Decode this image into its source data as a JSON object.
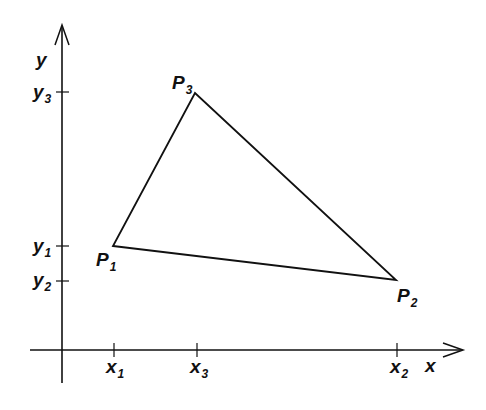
{
  "diagram": {
    "type": "triangle-on-axes",
    "colors": {
      "stroke": "#111111",
      "background": "#ffffff"
    },
    "axes": {
      "x_label": "x",
      "y_label": "y",
      "origin": [
        62,
        350
      ],
      "x_axis": {
        "from": [
          30,
          350
        ],
        "to": [
          463,
          350
        ]
      },
      "y_axis": {
        "from": [
          62,
          383
        ],
        "to": [
          62,
          25
        ]
      }
    },
    "points": [
      {
        "name": "P",
        "sub": "1",
        "px": [
          113,
          246
        ]
      },
      {
        "name": "P",
        "sub": "2",
        "px": [
          396,
          280
        ]
      },
      {
        "name": "P",
        "sub": "3",
        "px": [
          195,
          93
        ]
      }
    ],
    "x_ticks": [
      {
        "name": "x",
        "sub": "1",
        "px": 113
      },
      {
        "name": "x",
        "sub": "3",
        "px": 197
      },
      {
        "name": "x",
        "sub": "2",
        "px": 397
      }
    ],
    "y_ticks": [
      {
        "name": "y",
        "sub": "3",
        "px": 92
      },
      {
        "name": "y",
        "sub": "1",
        "px": 246
      },
      {
        "name": "y",
        "sub": "2",
        "px": 281
      }
    ]
  },
  "labels": {
    "y_axis": "y",
    "x_axis": "x",
    "p1": {
      "main": "P",
      "sub": "1"
    },
    "p2": {
      "main": "P",
      "sub": "2"
    },
    "p3": {
      "main": "P",
      "sub": "3"
    },
    "x1": {
      "main": "x",
      "sub": "1"
    },
    "x2": {
      "main": "x",
      "sub": "2"
    },
    "x3": {
      "main": "x",
      "sub": "3"
    },
    "y1": {
      "main": "y",
      "sub": "1"
    },
    "y2": {
      "main": "y",
      "sub": "2"
    },
    "y3": {
      "main": "y",
      "sub": "3"
    }
  }
}
